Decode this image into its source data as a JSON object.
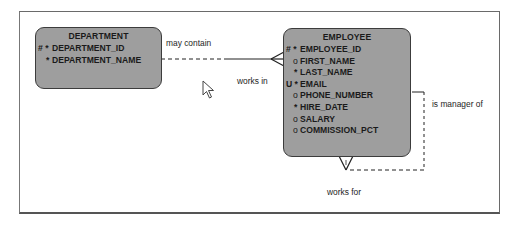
{
  "diagram": {
    "type": "entity-relationship",
    "entities": [
      {
        "name": "DEPARTMENT",
        "attributes": [
          {
            "mark": "# *",
            "name": "DEPARTMENT_ID"
          },
          {
            "mark": "*",
            "name": "DEPARTMENT_NAME"
          }
        ]
      },
      {
        "name": "EMPLOYEE",
        "attributes": [
          {
            "mark": "# *",
            "name": "EMPLOYEE_ID"
          },
          {
            "mark": "o",
            "name": "FIRST_NAME"
          },
          {
            "mark": "*",
            "name": "LAST_NAME"
          },
          {
            "mark": "U *",
            "name": "EMAIL"
          },
          {
            "mark": "o",
            "name": "PHONE_NUMBER"
          },
          {
            "mark": "*",
            "name": "HIRE_DATE"
          },
          {
            "mark": "o",
            "name": "SALARY"
          },
          {
            "mark": "o",
            "name": "COMMISSION_PCT"
          }
        ]
      }
    ],
    "relationships": [
      {
        "from": "DEPARTMENT",
        "to": "EMPLOYEE",
        "from_label": "may contain",
        "to_label": "works in"
      },
      {
        "from": "EMPLOYEE",
        "to": "EMPLOYEE",
        "from_label": "is manager of",
        "to_label": "works for"
      }
    ],
    "colors": {
      "entity_fill": "#9e9e9e",
      "entity_border": "#3c3c3c",
      "line": "#222222",
      "frame": "#6a6a6a"
    }
  }
}
